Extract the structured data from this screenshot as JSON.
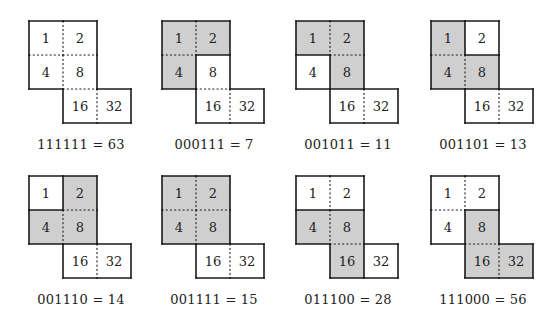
{
  "figure": {
    "cell_values": [
      1,
      2,
      4,
      8,
      16,
      32
    ],
    "shade_color": "#cfcfcf",
    "line_color": "#1a1a1a",
    "panels": [
      {
        "bits": "111111",
        "value": 63,
        "caption": "111111 = 63",
        "shaded": []
      },
      {
        "bits": "000111",
        "value": 7,
        "caption": "000111 = 7",
        "shaded": [
          1,
          2,
          4
        ]
      },
      {
        "bits": "001011",
        "value": 11,
        "caption": "001011 = 11",
        "shaded": [
          1,
          2,
          8
        ]
      },
      {
        "bits": "001101",
        "value": 13,
        "caption": "001101 = 13",
        "shaded": [
          1,
          4,
          8
        ]
      },
      {
        "bits": "001110",
        "value": 14,
        "caption": "001110 = 14",
        "shaded": [
          2,
          4,
          8
        ]
      },
      {
        "bits": "001111",
        "value": 15,
        "caption": "001111 = 15",
        "shaded": [
          1,
          2,
          4,
          8
        ]
      },
      {
        "bits": "011100",
        "value": 28,
        "caption": "011100 = 28",
        "shaded": [
          4,
          8,
          16
        ]
      },
      {
        "bits": "111000",
        "value": 56,
        "caption": "111000 = 56",
        "shaded": [
          8,
          16,
          32
        ]
      }
    ]
  }
}
